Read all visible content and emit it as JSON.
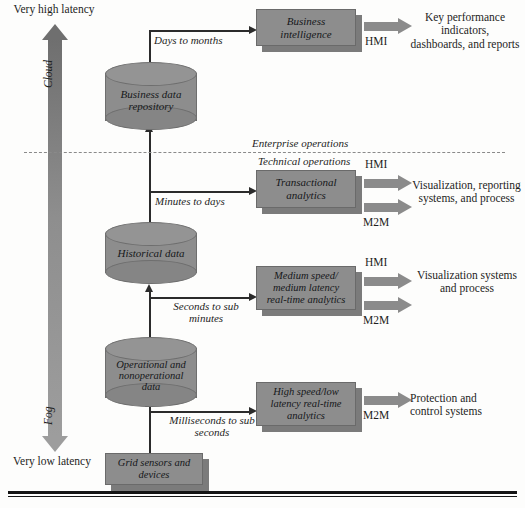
{
  "diagram": {
    "accent_gray": "#8d8d8d",
    "line_color": "#2b2b2b"
  },
  "latency_axis": {
    "top_label": "Very high latency",
    "bottom_label": "Very low latency",
    "upper_tier": "Cloud",
    "lower_tier": "Fog"
  },
  "divider": {
    "above_label": "Enterprise operations",
    "below_label": "Technical operations"
  },
  "data_stores": [
    {
      "name": "business-data-repository",
      "label": "Business data\nrepository"
    },
    {
      "name": "historical-data",
      "label": "Historical data"
    },
    {
      "name": "operational-data",
      "label": "Operational and\nnonoperational\ndata"
    }
  ],
  "source": {
    "label": "Grid sensors and\ndevices"
  },
  "flow_labels": [
    {
      "name": "days-to-months",
      "text": "Days to months"
    },
    {
      "name": "minutes-to-days",
      "text": "Minutes to days"
    },
    {
      "name": "seconds-to-sub-minutes",
      "text": "Seconds to sub\nminutes"
    },
    {
      "name": "milliseconds-to-sub-seconds",
      "text": "Milliseconds to sub\nseconds"
    }
  ],
  "analytics_boxes": [
    {
      "name": "business-intelligence",
      "label": "Business\nintelligence"
    },
    {
      "name": "transactional-analytics",
      "label": "Transactional\nanalytics"
    },
    {
      "name": "medium-speed-analytics",
      "label": "Medium speed/\nmedium latency\nreal-time analytics"
    },
    {
      "name": "high-speed-analytics",
      "label": "High speed/low\nlatency real-time\nanalytics"
    }
  ],
  "interfaces": {
    "hmi": "HMI",
    "m2m": "M2M"
  },
  "outcomes": [
    {
      "name": "kpi-dashboards",
      "text": "Key performance\nindicators,\ndashboards, and reports"
    },
    {
      "name": "visualization-reporting",
      "text": "Visualization, reporting\nsystems, and process"
    },
    {
      "name": "visualization-systems",
      "text": "Visualization systems\nand process"
    },
    {
      "name": "protection-control",
      "text": "Protection and\ncontrol systems"
    }
  ]
}
